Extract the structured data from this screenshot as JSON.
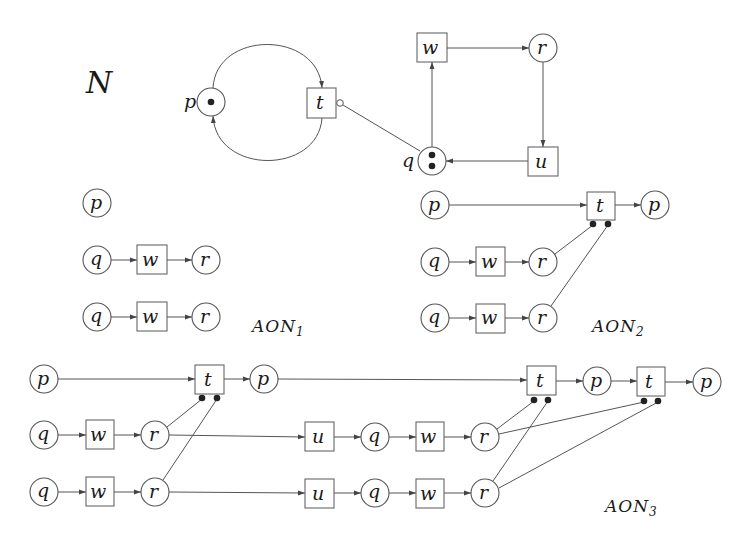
{
  "figure": {
    "net_title": "N",
    "labels": {
      "aon1": {
        "main": "AON",
        "sub": "1"
      },
      "aon2": {
        "main": "AON",
        "sub": "2"
      },
      "aon3": {
        "main": "AON",
        "sub": "3"
      }
    }
  },
  "net_N": {
    "places": [
      {
        "id": "p",
        "label": "p",
        "tokens": 1
      },
      {
        "id": "q",
        "label": "q",
        "tokens": 2
      },
      {
        "id": "r",
        "label": "r",
        "tokens": 0
      }
    ],
    "transitions": [
      {
        "id": "t",
        "label": "t"
      },
      {
        "id": "w",
        "label": "w"
      },
      {
        "id": "u",
        "label": "u"
      }
    ],
    "arcs": [
      {
        "from": "p",
        "to": "t",
        "type": "normal"
      },
      {
        "from": "t",
        "to": "p",
        "type": "normal"
      },
      {
        "from": "q",
        "to": "t",
        "type": "inhibitor"
      },
      {
        "from": "q",
        "to": "w",
        "type": "normal"
      },
      {
        "from": "w",
        "to": "r",
        "type": "normal"
      },
      {
        "from": "r",
        "to": "u",
        "type": "normal"
      },
      {
        "from": "u",
        "to": "q",
        "type": "normal"
      }
    ]
  },
  "node_text": {
    "p": "p",
    "q": "q",
    "r": "r",
    "t": "t",
    "w": "w",
    "u": "u"
  }
}
